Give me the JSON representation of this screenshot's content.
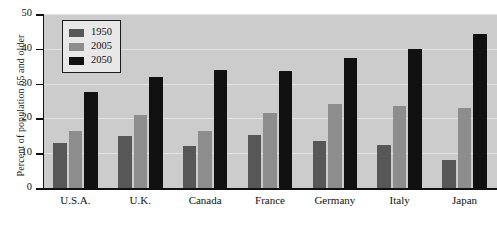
{
  "chart_data": {
    "type": "bar",
    "title": "",
    "xlabel": "",
    "ylabel": "Percent of population 65 and older",
    "ylim": [
      0,
      50
    ],
    "yticks": [
      0,
      10,
      20,
      30,
      40,
      50
    ],
    "grid": true,
    "legend_position": "top-left",
    "categories": [
      "U.S.A.",
      "U.K.",
      "Canada",
      "France",
      "Germany",
      "Italy",
      "Japan"
    ],
    "series": [
      {
        "name": "1950",
        "color": "#575757",
        "values": [
          12.8,
          15.0,
          12.0,
          15.2,
          13.5,
          12.5,
          8.0
        ]
      },
      {
        "name": "2005",
        "color": "#8d8d8d",
        "values": [
          16.5,
          21.0,
          16.5,
          21.5,
          24.0,
          23.5,
          23.0
        ]
      },
      {
        "name": "2050",
        "color": "#111111",
        "values": [
          27.5,
          32.0,
          34.0,
          33.5,
          37.5,
          40.0,
          44.3
        ]
      }
    ],
    "colors": {
      "plot_background": "#cccccc",
      "page_background": "#ffffff",
      "gridline": "#e2e2e2",
      "axis": "#111111"
    }
  }
}
